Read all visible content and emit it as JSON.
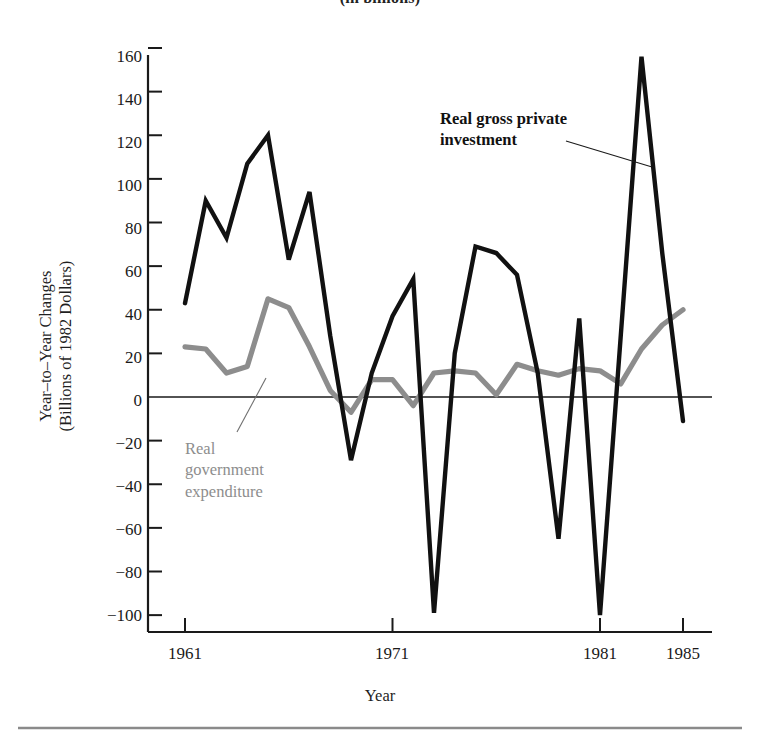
{
  "figure": {
    "title": "(in billions)",
    "bottom_rule": true
  },
  "chart_data": {
    "type": "line",
    "title": "(in billions)",
    "xlabel": "Year",
    "ylabel": "Year-to-Year Changes (Billions of 1982 Dollars)",
    "ylabel_line1": "Year–to–Year Changes",
    "ylabel_line2": "(Billions of 1982 Dollars)",
    "xlim": [
      1960,
      1985
    ],
    "ylim": [
      -100,
      160
    ],
    "ytick_labels": [
      "160",
      "140",
      "120",
      "100",
      "80",
      "60",
      "40",
      "20",
      "0",
      "−20",
      "−40",
      "−60",
      "−80",
      "−100"
    ],
    "yticks": [
      160,
      140,
      120,
      100,
      80,
      60,
      40,
      20,
      0,
      -20,
      -40,
      -60,
      -80,
      -100
    ],
    "xtick_labels": [
      "1961",
      "1971",
      "1981",
      "1985"
    ],
    "xticks": [
      1961,
      1971,
      1981,
      1985
    ],
    "grid": false,
    "zero_line": true,
    "legend_position": "inline-annotations",
    "x": [
      1961,
      1962,
      1963,
      1964,
      1965,
      1966,
      1967,
      1968,
      1969,
      1970,
      1971,
      1972,
      1973,
      1974,
      1975,
      1976,
      1977,
      1978,
      1979,
      1980,
      1981,
      1982,
      1983,
      1984,
      1985
    ],
    "series": [
      {
        "name": "Real gross private investment",
        "color": "#111111",
        "values": [
          43,
          90,
          73,
          107,
          120,
          63,
          94,
          28,
          -29,
          11,
          37,
          54,
          -99,
          20,
          69,
          66,
          56,
          11,
          -65,
          36,
          -100,
          28,
          156,
          66,
          -11
        ]
      },
      {
        "name": "Real government expenditure",
        "color": "#8d8d8d",
        "values": [
          23,
          22,
          11,
          14,
          45,
          41,
          23,
          3,
          -7,
          8,
          8,
          -4,
          11,
          12,
          11,
          1,
          15,
          12,
          10,
          13,
          12,
          6,
          22,
          33,
          40
        ]
      }
    ],
    "annotations": [
      {
        "name": "real-gross-private-investment",
        "line1": "Real gross private",
        "line2": "investment",
        "color": "#111111"
      },
      {
        "name": "real-government-expenditure",
        "line1": "Real",
        "line2": "government",
        "line3": "expenditure",
        "color": "#8d8d8d"
      }
    ]
  }
}
